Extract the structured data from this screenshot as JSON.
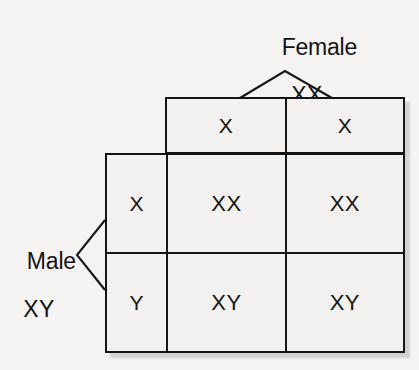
{
  "diagram": {
    "type": "punnett-square",
    "background_color": "#f5f4f2",
    "line_color": "#141414",
    "cell_fill": "#f2f1ef"
  },
  "parents": {
    "top": {
      "name": "Female",
      "genotype": "XX",
      "bracket": "inverted-v-bracket"
    },
    "left": {
      "name": "Male",
      "genotype": "XY",
      "bracket": "right-pointing-bracket"
    }
  },
  "grid": {
    "corner_label": "",
    "column_headers": [
      "X",
      "X"
    ],
    "row_headers": [
      "X",
      "Y"
    ],
    "rows": [
      {
        "header": "X",
        "cells": [
          "XX",
          "XX"
        ]
      },
      {
        "header": "Y",
        "cells": [
          "XY",
          "XY"
        ]
      }
    ]
  }
}
